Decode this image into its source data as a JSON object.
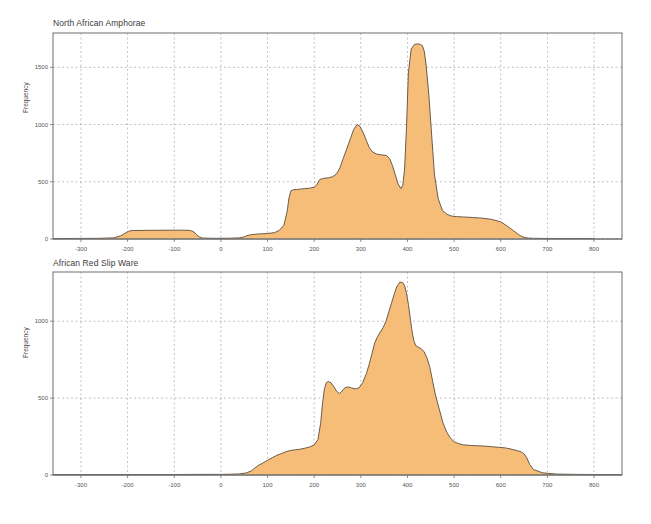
{
  "figure": {
    "background": "#ffffff",
    "axis_color": "#6e6e6e",
    "grid_color": "#9a9a9a",
    "fill_color": "#f6bd78",
    "line_color": "#6b5b4b",
    "ylabel": "Frequency"
  },
  "chart_data": [
    {
      "type": "area",
      "title": "North African Amphorae",
      "xlabel": "",
      "ylabel": "Frequency",
      "xlim": [
        -360,
        860
      ],
      "ylim": [
        0,
        1800
      ],
      "xticks": [
        -300,
        -200,
        -100,
        0,
        100,
        200,
        300,
        400,
        500,
        600,
        700,
        800
      ],
      "yticks": [
        0,
        500,
        1000,
        1500
      ],
      "grid": true,
      "legend": "none",
      "x": [
        -360,
        -330,
        -300,
        -260,
        -230,
        -215,
        -205,
        -198,
        -190,
        -150,
        -110,
        -80,
        -65,
        -58,
        -52,
        -45,
        -40,
        -20,
        0,
        20,
        40,
        48,
        55,
        65,
        80,
        100,
        115,
        125,
        135,
        142,
        146,
        150,
        155,
        162,
        170,
        180,
        190,
        200,
        205,
        212,
        220,
        230,
        240,
        248,
        255,
        262,
        270,
        278,
        285,
        292,
        298,
        305,
        312,
        318,
        325,
        335,
        345,
        355,
        362,
        368,
        374,
        380,
        386,
        390,
        394,
        398,
        402,
        408,
        415,
        422,
        428,
        432,
        436,
        440,
        446,
        452,
        458,
        466,
        475,
        485,
        495,
        505,
        520,
        540,
        560,
        580,
        600,
        615,
        628,
        638,
        645,
        652,
        660,
        670,
        690,
        720,
        760,
        800,
        830,
        860
      ],
      "y": [
        4,
        4,
        5,
        6,
        10,
        28,
        52,
        68,
        74,
        76,
        77,
        77,
        74,
        62,
        36,
        16,
        9,
        6,
        6,
        7,
        10,
        16,
        28,
        38,
        44,
        48,
        56,
        74,
        120,
        240,
        360,
        420,
        430,
        432,
        436,
        440,
        444,
        452,
        470,
        520,
        530,
        534,
        545,
        570,
        620,
        700,
        790,
        880,
        960,
        1000,
        985,
        930,
        860,
        800,
        760,
        740,
        735,
        730,
        700,
        640,
        560,
        480,
        440,
        470,
        620,
        980,
        1450,
        1660,
        1700,
        1705,
        1700,
        1690,
        1640,
        1520,
        1250,
        900,
        560,
        350,
        250,
        215,
        200,
        196,
        192,
        188,
        182,
        172,
        150,
        110,
        70,
        40,
        22,
        12,
        8,
        6,
        5,
        4,
        4,
        4
      ]
    },
    {
      "type": "area",
      "title": "African Red Slip Ware",
      "xlabel": "",
      "ylabel": "Frequency",
      "xlim": [
        -360,
        860
      ],
      "ylim": [
        0,
        1320
      ],
      "xticks": [
        -300,
        -200,
        -100,
        0,
        100,
        200,
        300,
        400,
        500,
        600,
        700,
        800
      ],
      "yticks": [
        0,
        500,
        1000
      ],
      "grid": true,
      "legend": "none",
      "x": [
        -360,
        -300,
        -250,
        -200,
        -150,
        -100,
        -50,
        0,
        20,
        40,
        55,
        65,
        72,
        80,
        90,
        100,
        110,
        120,
        130,
        140,
        150,
        160,
        170,
        180,
        190,
        200,
        208,
        214,
        218,
        222,
        226,
        230,
        236,
        242,
        248,
        254,
        258,
        262,
        268,
        274,
        280,
        288,
        296,
        304,
        312,
        318,
        324,
        330,
        336,
        342,
        348,
        354,
        360,
        366,
        372,
        378,
        384,
        390,
        394,
        398,
        402,
        406,
        410,
        414,
        418,
        424,
        430,
        436,
        442,
        448,
        454,
        460,
        468,
        476,
        484,
        492,
        500,
        510,
        520,
        535,
        550,
        565,
        580,
        595,
        610,
        620,
        628,
        636,
        644,
        650,
        656,
        662,
        670,
        690,
        720,
        760,
        800,
        830,
        860
      ],
      "y": [
        3,
        3,
        3,
        3,
        3,
        3,
        4,
        4,
        5,
        7,
        14,
        26,
        44,
        62,
        78,
        96,
        112,
        128,
        140,
        152,
        160,
        164,
        168,
        174,
        182,
        196,
        230,
        340,
        470,
        560,
        600,
        608,
        600,
        575,
        545,
        530,
        538,
        556,
        570,
        572,
        566,
        560,
        566,
        600,
        660,
        720,
        790,
        860,
        900,
        930,
        960,
        1000,
        1060,
        1120,
        1180,
        1230,
        1255,
        1250,
        1230,
        1180,
        1110,
        1020,
        930,
        870,
        840,
        830,
        820,
        800,
        760,
        700,
        610,
        520,
        430,
        340,
        280,
        240,
        216,
        204,
        196,
        192,
        190,
        188,
        184,
        180,
        176,
        170,
        164,
        158,
        150,
        138,
        110,
        70,
        36,
        14,
        6,
        4,
        3,
        3,
        3,
        3
      ]
    }
  ]
}
